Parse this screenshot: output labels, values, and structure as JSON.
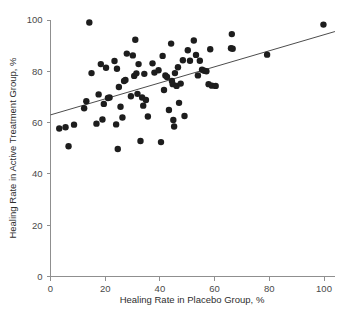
{
  "chart_data": {
    "type": "scatter",
    "title": "",
    "xlabel": "Healing Rate in Placebo Group, %",
    "ylabel": "Healing Rate in Active Treatment Group, %",
    "xlim": [
      0,
      104
    ],
    "ylim": [
      0,
      102
    ],
    "grid": false,
    "legend": null,
    "xticks": [
      0,
      20,
      40,
      60,
      80,
      100
    ],
    "yticks": [
      0,
      20,
      40,
      60,
      80,
      100
    ],
    "xtick_labels": [
      "0",
      "20",
      "40",
      "60",
      "80",
      "100"
    ],
    "ytick_labels": [
      "0",
      "20",
      "40",
      "60",
      "80",
      "100"
    ],
    "marker": "filled-circle",
    "marker_color": "#1d1d1d",
    "marker_size_px": 3.2,
    "series": [
      {
        "name": "trials",
        "points": [
          [
            3.2,
            57.7
          ],
          [
            5.5,
            58.2
          ],
          [
            6.6,
            50.8
          ],
          [
            8.6,
            59.2
          ],
          [
            12.3,
            65.6
          ],
          [
            13.1,
            68.3
          ],
          [
            14.2,
            99.0
          ],
          [
            15.0,
            79.3
          ],
          [
            16.8,
            59.6
          ],
          [
            17.6,
            71.0
          ],
          [
            18.4,
            82.8
          ],
          [
            19.0,
            61.2
          ],
          [
            19.5,
            67.3
          ],
          [
            20.3,
            81.4
          ],
          [
            21.0,
            69.6
          ],
          [
            21.6,
            69.8
          ],
          [
            23.4,
            84.0
          ],
          [
            24.0,
            59.3
          ],
          [
            24.3,
            81.0
          ],
          [
            24.6,
            49.7
          ],
          [
            25.0,
            73.9
          ],
          [
            25.6,
            66.2
          ],
          [
            26.3,
            62.0
          ],
          [
            26.9,
            76.2
          ],
          [
            27.4,
            76.6
          ],
          [
            27.9,
            86.9
          ],
          [
            29.4,
            70.3
          ],
          [
            30.1,
            86.2
          ],
          [
            30.6,
            78.2
          ],
          [
            31.0,
            92.3
          ],
          [
            31.4,
            79.2
          ],
          [
            31.8,
            71.2
          ],
          [
            32.2,
            82.8
          ],
          [
            32.9,
            52.8
          ],
          [
            33.5,
            69.8
          ],
          [
            33.9,
            66.6
          ],
          [
            34.3,
            79.0
          ],
          [
            34.9,
            68.8
          ],
          [
            35.6,
            62.4
          ],
          [
            37.3,
            83.1
          ],
          [
            38.0,
            79.5
          ],
          [
            39.5,
            80.4
          ],
          [
            40.4,
            52.4
          ],
          [
            41.0,
            86.0
          ],
          [
            41.5,
            72.7
          ],
          [
            42.0,
            78.4
          ],
          [
            42.6,
            77.8
          ],
          [
            43.3,
            64.9
          ],
          [
            44.1,
            90.8
          ],
          [
            44.4,
            76.2
          ],
          [
            44.7,
            75.0
          ],
          [
            44.9,
            61.0
          ],
          [
            45.2,
            58.5
          ],
          [
            45.5,
            79.3
          ],
          [
            46.1,
            74.3
          ],
          [
            46.6,
            81.6
          ],
          [
            47.0,
            67.7
          ],
          [
            47.6,
            75.2
          ],
          [
            48.4,
            84.3
          ],
          [
            49.0,
            62.6
          ],
          [
            50.2,
            88.2
          ],
          [
            51.0,
            84.1
          ],
          [
            52.4,
            92.0
          ],
          [
            53.2,
            86.4
          ],
          [
            53.9,
            78.4
          ],
          [
            54.6,
            84.1
          ],
          [
            55.4,
            80.6
          ],
          [
            56.2,
            80.2
          ],
          [
            57.0,
            80.0
          ],
          [
            57.8,
            75.0
          ],
          [
            58.4,
            88.6
          ],
          [
            59.0,
            74.4
          ],
          [
            60.4,
            74.3
          ],
          [
            66.0,
            89.0
          ],
          [
            66.3,
            94.5
          ],
          [
            66.6,
            88.8
          ],
          [
            79.2,
            86.5
          ],
          [
            99.8,
            98.2
          ]
        ]
      }
    ],
    "fit_line": {
      "name": "regression line",
      "x0": 0,
      "y0": 63.0,
      "x1": 104,
      "y1": 95.5,
      "color": "#4d4d4d"
    }
  }
}
